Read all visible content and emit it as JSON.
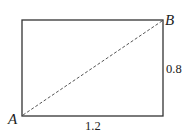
{
  "diagram": {
    "type": "rectangle-with-diagonal",
    "rectangle": {
      "x": 22,
      "y": 20,
      "width": 141,
      "height": 96,
      "stroke": "#333333"
    },
    "diagonal": {
      "from": "A",
      "to": "B",
      "style": "dashed",
      "stroke": "#555555"
    },
    "points": [
      {
        "name": "A",
        "label": "A",
        "x": 22,
        "y": 116
      },
      {
        "name": "B",
        "label": "B",
        "x": 163,
        "y": 20
      }
    ],
    "dimensions": {
      "width_label": "1.2",
      "height_label": "0.8"
    }
  }
}
